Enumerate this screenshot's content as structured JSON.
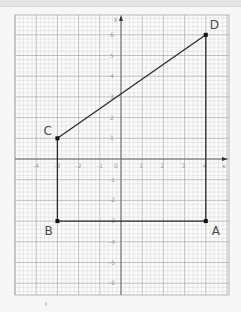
{
  "chart_data": {
    "type": "scatter",
    "title": "",
    "xlabel": "x",
    "ylabel": "y",
    "xlim": [
      -4.5,
      5.3
    ],
    "ylim": [
      -6.5,
      7
    ],
    "grid": true,
    "x_ticks": [
      "-4",
      "-3",
      "-2",
      "-1",
      "0",
      "1",
      "2",
      "3",
      "4"
    ],
    "y_ticks": [
      "6",
      "5",
      "4",
      "3",
      "2",
      "1",
      "-1",
      "-2",
      "-3",
      "-4",
      "-5",
      "-6"
    ],
    "points": [
      {
        "label": "A",
        "x": 4,
        "y": -3
      },
      {
        "label": "B",
        "x": -3,
        "y": -3
      },
      {
        "label": "C",
        "x": -3,
        "y": 1
      },
      {
        "label": "D",
        "x": 4,
        "y": 6
      }
    ],
    "segments": [
      {
        "from": "A",
        "to": "B"
      },
      {
        "from": "B",
        "to": "C"
      },
      {
        "from": "C",
        "to": "D"
      },
      {
        "from": "D",
        "to": "A"
      }
    ],
    "shape": "quadrilateral ABCD"
  },
  "labels": {
    "A": "A",
    "B": "B",
    "C": "C",
    "D": "D",
    "x_axis": "x",
    "y_axis": "y",
    "origin": "0"
  },
  "colors": {
    "background": "#f7f7f7",
    "grid_minor": "#d0d0d0",
    "grid_major": "#a8a8a8",
    "axis": "#6a6a6a",
    "shape": "#2a2a2a"
  }
}
